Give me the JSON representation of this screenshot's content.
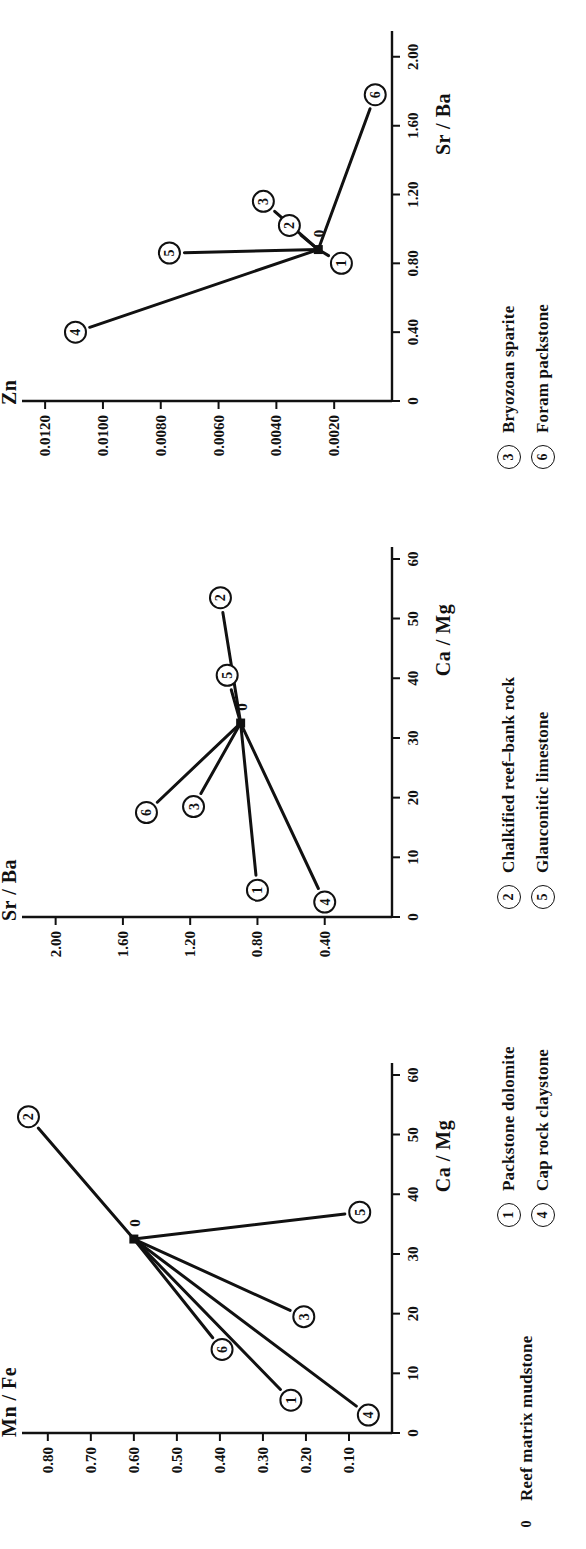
{
  "figure": {
    "orientation": "rotated-90-ccw",
    "panel_count": 3,
    "ink_color": "#111111",
    "background_color": "#ffffff"
  },
  "legend": {
    "columns": [
      {
        "items": [
          {
            "key": "0",
            "circled": false,
            "label": "Reef matrix mudstone"
          }
        ]
      },
      {
        "items": [
          {
            "key": "1",
            "circled": true,
            "label": "Packstone dolomite"
          },
          {
            "key": "4",
            "circled": true,
            "label": "Cap rock claystone"
          }
        ]
      },
      {
        "items": [
          {
            "key": "2",
            "circled": true,
            "label": "Chalkified reef–bank rock"
          },
          {
            "key": "5",
            "circled": true,
            "label": "Glauconitic limestone"
          }
        ]
      },
      {
        "items": [
          {
            "key": "3",
            "circled": true,
            "label": "Bryozoan sparite"
          },
          {
            "key": "6",
            "circled": true,
            "label": "Foram packstone"
          }
        ]
      }
    ]
  },
  "chart_data": [
    {
      "type": "scatter",
      "id": "panel-1-mnfe-vs-camg",
      "title": "",
      "xlabel": "Ca / Mg",
      "ylabel": "Mn / Fe",
      "xlim": [
        0,
        62
      ],
      "ylim": [
        0,
        0.86
      ],
      "xticks": [
        0,
        10,
        20,
        30,
        40,
        50,
        60
      ],
      "xticklabels": [
        "0",
        "10",
        "20",
        "30",
        "40",
        "50",
        "60"
      ],
      "yticks": [
        0.1,
        0.2,
        0.3,
        0.4,
        0.5,
        0.6,
        0.7,
        0.8
      ],
      "yticklabels": [
        "0.10",
        "0.20",
        "0.30",
        "0.40",
        "0.50",
        "0.60",
        "0.70",
        "0.80"
      ],
      "grid": false,
      "legend_position": "below-figure",
      "origin_point": {
        "label": "0",
        "x": 32.5,
        "y": 0.6
      },
      "points": [
        {
          "label": "1",
          "x": 5.5,
          "y": 0.235
        },
        {
          "label": "2",
          "x": 53.0,
          "y": 0.845
        },
        {
          "label": "3",
          "x": 19.5,
          "y": 0.205
        },
        {
          "label": "4",
          "x": 3.0,
          "y": 0.055
        },
        {
          "label": "5",
          "x": 37.0,
          "y": 0.075
        },
        {
          "label": "6",
          "x": 14.0,
          "y": 0.395
        }
      ]
    },
    {
      "type": "scatter",
      "id": "panel-2-srba-vs-camg",
      "title": "",
      "xlabel": "Ca / Mg",
      "ylabel": "Sr / Ba",
      "xlim": [
        0,
        62
      ],
      "ylim": [
        0,
        2.2
      ],
      "xticks": [
        0,
        10,
        20,
        30,
        40,
        50,
        60
      ],
      "xticklabels": [
        "0",
        "10",
        "20",
        "30",
        "40",
        "50",
        "60"
      ],
      "yticks": [
        0.4,
        0.8,
        1.2,
        1.6,
        2.0
      ],
      "yticklabels": [
        "0.40",
        "0.80",
        "1.20",
        "1.60",
        "2.00"
      ],
      "grid": false,
      "legend_position": "below-figure",
      "origin_point": {
        "label": "0",
        "x": 32.5,
        "y": 0.9
      },
      "points": [
        {
          "label": "1",
          "x": 4.5,
          "y": 0.8
        },
        {
          "label": "2",
          "x": 53.5,
          "y": 1.02
        },
        {
          "label": "3",
          "x": 18.5,
          "y": 1.18
        },
        {
          "label": "4",
          "x": 2.5,
          "y": 0.4
        },
        {
          "label": "5",
          "x": 40.5,
          "y": 0.98
        },
        {
          "label": "6",
          "x": 17.5,
          "y": 1.46
        }
      ]
    },
    {
      "type": "scatter",
      "id": "panel-3-zn-vs-srba",
      "title": "",
      "xlabel": "Sr / Ba",
      "ylabel": "Zn",
      "xlim": [
        0,
        2.15
      ],
      "ylim": [
        0,
        0.0128
      ],
      "xticks": [
        0,
        0.4,
        0.8,
        1.2,
        1.6,
        2.0
      ],
      "xticklabels": [
        "0",
        "0.40",
        "0.80",
        "1.20",
        "1.60",
        "2.00"
      ],
      "yticks": [
        0.002,
        0.004,
        0.006,
        0.008,
        0.01,
        0.012
      ],
      "yticklabels": [
        "0.0020",
        "0.0040",
        "0.0060",
        "0.0080",
        "0.0100",
        "0.0120"
      ],
      "grid": false,
      "legend_position": "below-figure",
      "origin_point": {
        "label": "0",
        "x": 0.88,
        "y": 0.00255
      },
      "points": [
        {
          "label": "1",
          "x": 0.8,
          "y": 0.00175
        },
        {
          "label": "2",
          "x": 1.02,
          "y": 0.00355
        },
        {
          "label": "3",
          "x": 1.16,
          "y": 0.00445
        },
        {
          "label": "4",
          "x": 0.4,
          "y": 0.01095
        },
        {
          "label": "5",
          "x": 0.86,
          "y": 0.0077
        },
        {
          "label": "6",
          "x": 1.78,
          "y": 0.00058
        }
      ]
    }
  ]
}
